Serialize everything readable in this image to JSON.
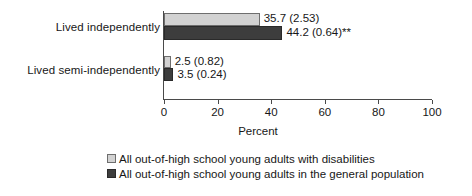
{
  "chart_data": {
    "type": "bar",
    "orientation": "horizontal",
    "title": "",
    "xlabel": "Percent",
    "ylabel": "",
    "xlim": [
      0,
      100
    ],
    "xticks": [
      0,
      20,
      40,
      60,
      80,
      100
    ],
    "xtick_labels": [
      "0",
      "20",
      "40",
      "60",
      "80",
      "100"
    ],
    "grid": false,
    "legend_position": "bottom",
    "categories": [
      "Lived independently",
      "Lived semi-independently"
    ],
    "series": [
      {
        "name": "All out-of-high school young adults with disabilities",
        "color": "#d2d2d2",
        "values": [
          35.7,
          2.5
        ],
        "standard_errors": [
          2.53,
          0.82
        ],
        "value_labels": [
          "35.7 (2.53)",
          "2.5 (0.82)"
        ]
      },
      {
        "name": "All out-of-high school young adults in the general population",
        "color": "#3d3d3d",
        "values": [
          44.2,
          3.5
        ],
        "standard_errors": [
          0.64,
          0.24
        ],
        "value_labels": [
          "44.2 (0.64)**",
          "3.5 (0.24)"
        ]
      }
    ],
    "annotations": [
      "** denotes statistical significance"
    ]
  },
  "axis": {
    "title": "Percent"
  },
  "categories": [
    {
      "label": "Lived independently"
    },
    {
      "label": "Lived semi-independently"
    }
  ],
  "ticks": [
    {
      "label": "0"
    },
    {
      "label": "20"
    },
    {
      "label": "40"
    },
    {
      "label": "60"
    },
    {
      "label": "80"
    },
    {
      "label": "100"
    }
  ],
  "bars": {
    "g0s0": {
      "label": "35.7 (2.53)"
    },
    "g0s1": {
      "label": "44.2 (0.64)**"
    },
    "g1s0": {
      "label": "2.5 (0.82)"
    },
    "g1s1": {
      "label": "3.5 (0.24)"
    }
  },
  "legend": [
    {
      "label": "All out-of-high school young adults with disabilities"
    },
    {
      "label": "All out-of-high school young adults in the general population"
    }
  ]
}
